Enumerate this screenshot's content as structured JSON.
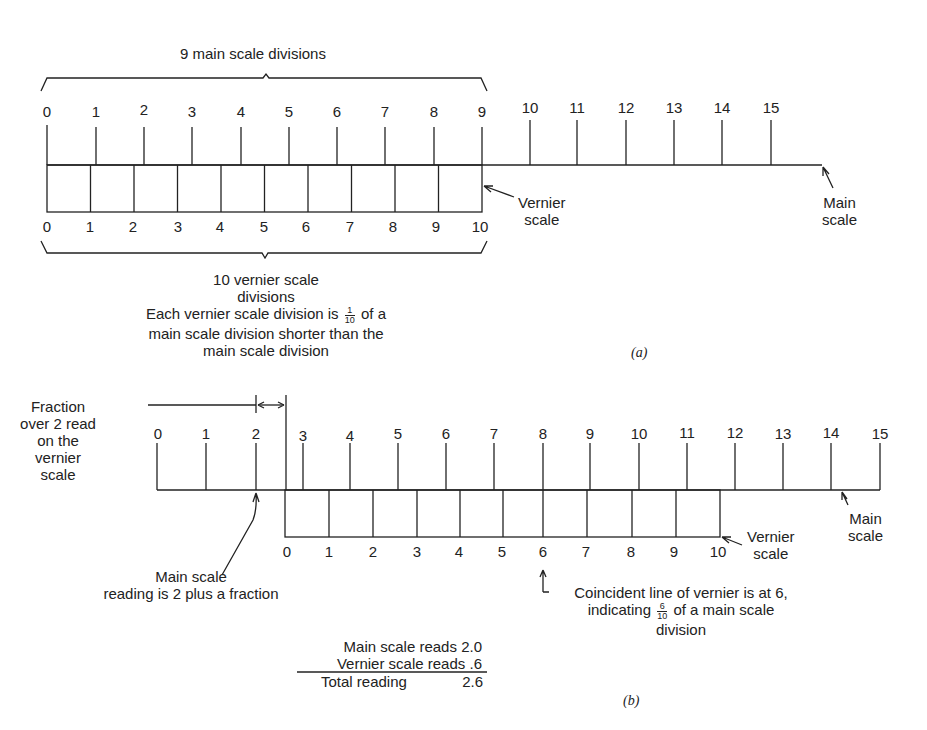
{
  "part_a": {
    "caption": "(a)",
    "top_brace_label": "9 main scale divisions",
    "main_scale_ticks": [
      "0",
      "1",
      "2",
      "3",
      "4",
      "5",
      "6",
      "7",
      "8",
      "9",
      "10",
      "11",
      "12",
      "13",
      "14",
      "15"
    ],
    "vernier_ticks": [
      "0",
      "1",
      "2",
      "3",
      "4",
      "5",
      "6",
      "7",
      "8",
      "9",
      "10"
    ],
    "vernier_label_line1": "Vernier",
    "vernier_label_line2": "scale",
    "main_label_line1": "Main",
    "main_label_line2": "scale",
    "bottom_brace_label_line1": "10 vernier scale",
    "bottom_brace_label_line2": "divisions",
    "note_line1_pre": "Each vernier scale division is",
    "note_frac_num": "1",
    "note_frac_den": "10",
    "note_line1_post": "of a",
    "note_line2": "main scale division shorter than the",
    "note_line3": "main scale division"
  },
  "part_b": {
    "caption": "(b)",
    "main_scale_ticks": [
      "0",
      "1",
      "2",
      "3",
      "4",
      "5",
      "6",
      "7",
      "8",
      "9",
      "10",
      "11",
      "12",
      "13",
      "14",
      "15"
    ],
    "vernier_ticks": [
      "0",
      "1",
      "2",
      "3",
      "4",
      "5",
      "6",
      "7",
      "8",
      "9",
      "10"
    ],
    "fraction_label": [
      "Fraction",
      "over 2 read",
      "on the",
      "vernier",
      "scale"
    ],
    "main_reading_label_line1": "Main scale",
    "main_reading_label_line2": "reading is 2 plus a fraction",
    "vernier_label_line1": "Vernier",
    "vernier_label_line2": "scale",
    "main_label_line1": "Main",
    "main_label_line2": "scale",
    "coincident_line1": "Coincident line of vernier is at 6,",
    "coincident_line2_pre": "indicating",
    "coincident_frac_num": "6",
    "coincident_frac_den": "10",
    "coincident_line2_post": "of a main scale",
    "coincident_line3": "division",
    "summary": {
      "main_reads_label": "Main scale reads",
      "main_reads_value": "2.0",
      "vernier_reads_label": "Vernier scale reads",
      "vernier_reads_value": ".6",
      "total_label": "Total reading",
      "total_value": "2.6"
    }
  }
}
